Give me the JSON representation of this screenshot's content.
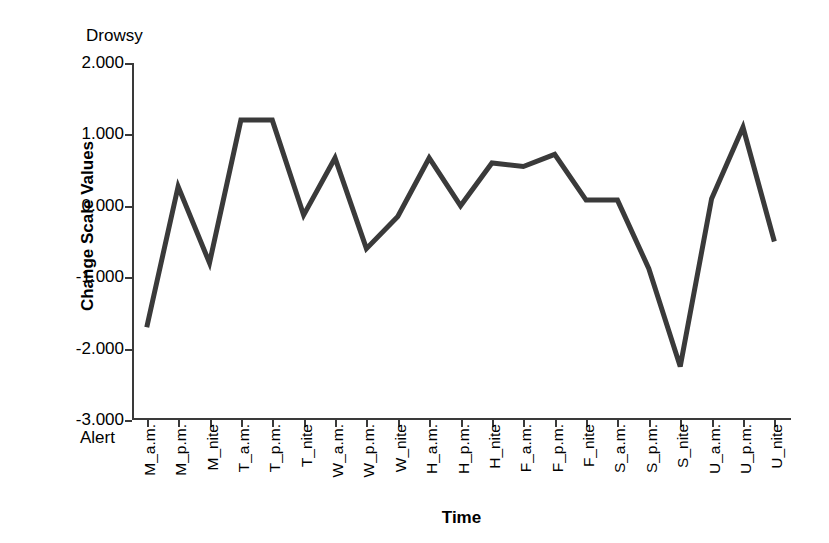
{
  "chart_data": {
    "type": "line",
    "title": "",
    "xlabel": "Time",
    "ylabel": "Change Scale Values",
    "ylim": [
      -3.0,
      2.0
    ],
    "yticks": [
      "2.000",
      "1.000",
      "0.000",
      "-1.000",
      "-2.000",
      "-3.000"
    ],
    "ytick_values": [
      2.0,
      1.0,
      0.0,
      -1.0,
      -2.0,
      -3.0
    ],
    "grid": false,
    "legend": "none",
    "top_anchor_label": "Drowsy",
    "bottom_anchor_label": "Alert",
    "line_color": "#3a3a3a",
    "categories": [
      "M_a.m.",
      "M_p.m.",
      "M_nite",
      "T_a.m.",
      "T_p.m.",
      "T_nite",
      "W_a.m.",
      "W_p.m.",
      "W_nite",
      "H_a.m.",
      "H_p.m.",
      "H_nite",
      "F_a.m.",
      "F_p.m.",
      "F_nite",
      "S_a.m.",
      "S_p.m.",
      "S_nite",
      "U_a.m.",
      "U_p.m.",
      "U_nite"
    ],
    "values": [
      -1.7,
      0.27,
      -0.8,
      1.2,
      1.2,
      -0.13,
      0.67,
      -0.6,
      -0.15,
      0.67,
      0.0,
      0.6,
      0.55,
      0.72,
      0.08,
      0.08,
      -0.88,
      -2.25,
      0.1,
      1.1,
      -0.5
    ]
  }
}
